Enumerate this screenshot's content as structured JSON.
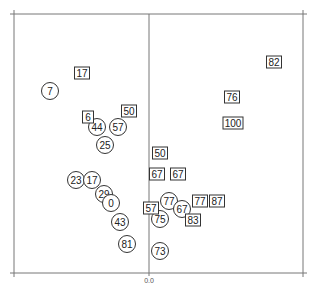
{
  "chart_data": {
    "type": "scatter",
    "title": "",
    "xlabel": "",
    "ylabel": "",
    "x_tick_labels": [
      "0.0"
    ],
    "grid": false,
    "legend": null,
    "frame": {
      "left": 14,
      "top": 14,
      "right": 303,
      "bottom": 273,
      "zero_line_x": 149
    },
    "series": [
      {
        "name": "circles",
        "marker": "circle",
        "points": [
          {
            "label": "7",
            "x": 50,
            "y": 91
          },
          {
            "label": "44",
            "x": 97,
            "y": 127
          },
          {
            "label": "57",
            "x": 118,
            "y": 127
          },
          {
            "label": "25",
            "x": 105,
            "y": 145
          },
          {
            "label": "23",
            "x": 76,
            "y": 180
          },
          {
            "label": "17",
            "x": 92,
            "y": 180
          },
          {
            "label": "29",
            "x": 104,
            "y": 194
          },
          {
            "label": "0",
            "x": 111,
            "y": 203
          },
          {
            "label": "43",
            "x": 120,
            "y": 222
          },
          {
            "label": "81",
            "x": 127,
            "y": 244
          },
          {
            "label": "77",
            "x": 169,
            "y": 201
          },
          {
            "label": "67",
            "x": 182,
            "y": 209
          },
          {
            "label": "75",
            "x": 160,
            "y": 219
          },
          {
            "label": "73",
            "x": 160,
            "y": 251
          }
        ]
      },
      {
        "name": "squares",
        "marker": "square",
        "points": [
          {
            "label": "17",
            "x": 82,
            "y": 73
          },
          {
            "label": "6",
            "x": 88,
            "y": 117
          },
          {
            "label": "50",
            "x": 129,
            "y": 111
          },
          {
            "label": "50",
            "x": 160,
            "y": 153
          },
          {
            "label": "67",
            "x": 157,
            "y": 174
          },
          {
            "label": "67",
            "x": 178,
            "y": 174
          },
          {
            "label": "57",
            "x": 151,
            "y": 208
          },
          {
            "label": "83",
            "x": 193,
            "y": 220
          },
          {
            "label": "77",
            "x": 200,
            "y": 201
          },
          {
            "label": "87",
            "x": 217,
            "y": 201
          },
          {
            "label": "82",
            "x": 274,
            "y": 62
          },
          {
            "label": "76",
            "x": 232,
            "y": 97
          },
          {
            "label": "100",
            "x": 233,
            "y": 123
          }
        ]
      }
    ]
  }
}
